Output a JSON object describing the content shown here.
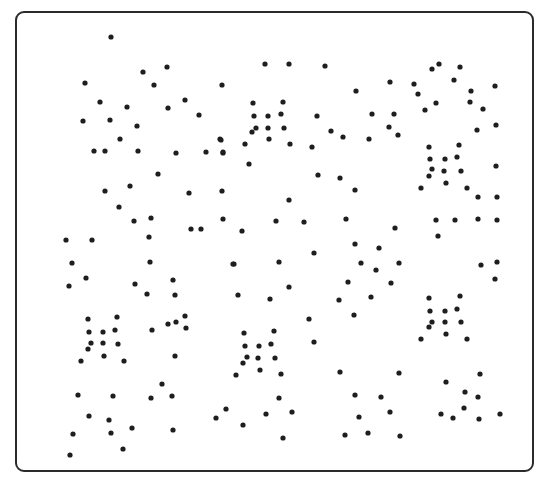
{
  "figure": {
    "frame": {
      "x": 15,
      "y": 11,
      "width": 519,
      "height": 461,
      "stroke": "#2b2b2b",
      "radius": 9
    },
    "dot_color": "#1e1e1e",
    "dot_radius": 2.6,
    "dots": [
      [
        111,
        37
      ],
      [
        85,
        83
      ],
      [
        143,
        72
      ],
      [
        167,
        67
      ],
      [
        154,
        85
      ],
      [
        100,
        102
      ],
      [
        127,
        107
      ],
      [
        168,
        108
      ],
      [
        185,
        100
      ],
      [
        199,
        115
      ],
      [
        83,
        121
      ],
      [
        110,
        120
      ],
      [
        137,
        126
      ],
      [
        120,
        139
      ],
      [
        94,
        151
      ],
      [
        105,
        151
      ],
      [
        138,
        151
      ],
      [
        176,
        153
      ],
      [
        220,
        139
      ],
      [
        206,
        152
      ],
      [
        223,
        152
      ],
      [
        265,
        64
      ],
      [
        289,
        64
      ],
      [
        325,
        66
      ],
      [
        222,
        85
      ],
      [
        356,
        91
      ],
      [
        390,
        82
      ],
      [
        253,
        103
      ],
      [
        283,
        102
      ],
      [
        254,
        116
      ],
      [
        268,
        116
      ],
      [
        281,
        114
      ],
      [
        317,
        116
      ],
      [
        372,
        114
      ],
      [
        394,
        114
      ],
      [
        256,
        128
      ],
      [
        268,
        128
      ],
      [
        284,
        128
      ],
      [
        252,
        132
      ],
      [
        331,
        131
      ],
      [
        343,
        137
      ],
      [
        389,
        127
      ],
      [
        398,
        135
      ],
      [
        369,
        139
      ],
      [
        221,
        140
      ],
      [
        269,
        139
      ],
      [
        245,
        144
      ],
      [
        290,
        144
      ],
      [
        312,
        147
      ],
      [
        223,
        153
      ],
      [
        249,
        164
      ],
      [
        432,
        69
      ],
      [
        439,
        64
      ],
      [
        460,
        67
      ],
      [
        414,
        84
      ],
      [
        454,
        80
      ],
      [
        418,
        94
      ],
      [
        471,
        91
      ],
      [
        495,
        86
      ],
      [
        436,
        103
      ],
      [
        470,
        102
      ],
      [
        425,
        110
      ],
      [
        483,
        109
      ],
      [
        477,
        130
      ],
      [
        496,
        125
      ],
      [
        429,
        147
      ],
      [
        459,
        145
      ],
      [
        430,
        159
      ],
      [
        445,
        159
      ],
      [
        457,
        157
      ],
      [
        432,
        169
      ],
      [
        444,
        171
      ],
      [
        461,
        171
      ],
      [
        496,
        166
      ],
      [
        429,
        176
      ],
      [
        446,
        183
      ],
      [
        421,
        188
      ],
      [
        467,
        188
      ],
      [
        478,
        197
      ],
      [
        497,
        197
      ],
      [
        158,
        174
      ],
      [
        105,
        191
      ],
      [
        130,
        186
      ],
      [
        189,
        193
      ],
      [
        222,
        191
      ],
      [
        119,
        207
      ],
      [
        134,
        221
      ],
      [
        151,
        218
      ],
      [
        223,
        219
      ],
      [
        191,
        229
      ],
      [
        201,
        229
      ],
      [
        149,
        237
      ],
      [
        66,
        240
      ],
      [
        92,
        240
      ],
      [
        72,
        263
      ],
      [
        150,
        262
      ],
      [
        86,
        278
      ],
      [
        69,
        286
      ],
      [
        135,
        284
      ],
      [
        173,
        280
      ],
      [
        147,
        294
      ],
      [
        175,
        295
      ],
      [
        233,
        264
      ],
      [
        318,
        175
      ],
      [
        340,
        178
      ],
      [
        355,
        190
      ],
      [
        289,
        200
      ],
      [
        276,
        221
      ],
      [
        304,
        222
      ],
      [
        346,
        219
      ],
      [
        395,
        228
      ],
      [
        242,
        231
      ],
      [
        355,
        244
      ],
      [
        379,
        248
      ],
      [
        314,
        253
      ],
      [
        234,
        264
      ],
      [
        279,
        262
      ],
      [
        361,
        263
      ],
      [
        376,
        270
      ],
      [
        399,
        263
      ],
      [
        348,
        282
      ],
      [
        289,
        287
      ],
      [
        391,
        283
      ],
      [
        238,
        295
      ],
      [
        270,
        299
      ],
      [
        339,
        300
      ],
      [
        371,
        297
      ],
      [
        354,
        315
      ],
      [
        436,
        220
      ],
      [
        455,
        220
      ],
      [
        478,
        219
      ],
      [
        497,
        220
      ],
      [
        438,
        236
      ],
      [
        481,
        265
      ],
      [
        497,
        262
      ],
      [
        495,
        279
      ],
      [
        429,
        298
      ],
      [
        460,
        296
      ],
      [
        430,
        311
      ],
      [
        445,
        311
      ],
      [
        457,
        309
      ],
      [
        432,
        322
      ],
      [
        445,
        322
      ],
      [
        461,
        322
      ],
      [
        429,
        327
      ],
      [
        446,
        334
      ],
      [
        421,
        339
      ],
      [
        467,
        339
      ],
      [
        88,
        319
      ],
      [
        117,
        317
      ],
      [
        89,
        332
      ],
      [
        103,
        332
      ],
      [
        115,
        330
      ],
      [
        91,
        343
      ],
      [
        103,
        343
      ],
      [
        118,
        344
      ],
      [
        88,
        349
      ],
      [
        104,
        356
      ],
      [
        81,
        361
      ],
      [
        124,
        361
      ],
      [
        152,
        330
      ],
      [
        168,
        324
      ],
      [
        176,
        322
      ],
      [
        185,
        316
      ],
      [
        186,
        328
      ],
      [
        175,
        356
      ],
      [
        162,
        384
      ],
      [
        309,
        319
      ],
      [
        244,
        333
      ],
      [
        274,
        331
      ],
      [
        245,
        346
      ],
      [
        259,
        346
      ],
      [
        271,
        344
      ],
      [
        314,
        342
      ],
      [
        247,
        357
      ],
      [
        258,
        358
      ],
      [
        275,
        358
      ],
      [
        243,
        363
      ],
      [
        260,
        370
      ],
      [
        236,
        375
      ],
      [
        281,
        374
      ],
      [
        340,
        372
      ],
      [
        399,
        373
      ],
      [
        279,
        398
      ],
      [
        355,
        395
      ],
      [
        381,
        397
      ],
      [
        78,
        395
      ],
      [
        113,
        396
      ],
      [
        151,
        398
      ],
      [
        172,
        396
      ],
      [
        89,
        416
      ],
      [
        109,
        420
      ],
      [
        73,
        434
      ],
      [
        111,
        433
      ],
      [
        132,
        428
      ],
      [
        173,
        430
      ],
      [
        123,
        449
      ],
      [
        70,
        455
      ],
      [
        216,
        418
      ],
      [
        226,
        409
      ],
      [
        266,
        414
      ],
      [
        292,
        412
      ],
      [
        243,
        425
      ],
      [
        283,
        438
      ],
      [
        390,
        412
      ],
      [
        359,
        417
      ],
      [
        345,
        435
      ],
      [
        368,
        433
      ],
      [
        400,
        436
      ],
      [
        480,
        374
      ],
      [
        446,
        382
      ],
      [
        465,
        392
      ],
      [
        478,
        397
      ],
      [
        464,
        408
      ],
      [
        441,
        414
      ],
      [
        453,
        418
      ],
      [
        479,
        419
      ],
      [
        500,
        414
      ]
    ]
  }
}
